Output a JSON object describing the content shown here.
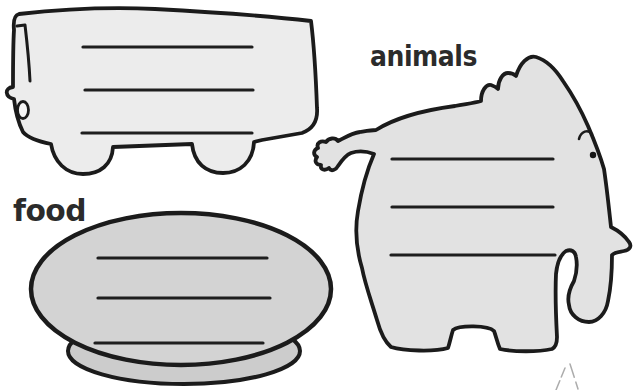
{
  "page": {
    "background": "#ffffff"
  },
  "labels": {
    "animals": "animals",
    "food": "food"
  },
  "shapes": {
    "bus": {
      "fill": "#ececec",
      "writing_line_count": 3
    },
    "elephant": {
      "fill": "#e2e2e2",
      "writing_line_count": 3
    },
    "plate": {
      "fill": "#d3d3d3",
      "rim_fill": "#cccccc",
      "writing_line_count": 3
    }
  },
  "colors": {
    "outline": "#1b1b1b",
    "writing_line": "#1e1e1e",
    "label_text": "#2b2b2b",
    "headlight_fill": "#f4f4f4",
    "sketch_mark": "#9e9e9e"
  }
}
